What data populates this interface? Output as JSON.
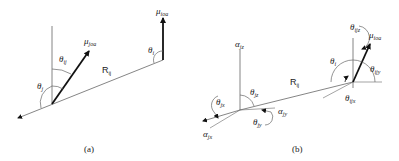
{
  "panels": [
    {
      "caption": "(a)",
      "labels": {
        "mu_joa": {
          "sym": "μ",
          "sub": "joa"
        },
        "mu_ioa": {
          "sym": "μ",
          "sub": "ioa"
        },
        "theta_ij": {
          "sym": "θ",
          "sub": "ij"
        },
        "theta_j": {
          "sym": "θ",
          "sub": "j"
        },
        "theta_i": {
          "sym": "θ",
          "sub": "i"
        },
        "R_ij": {
          "sym": "R",
          "sub": "ij"
        }
      }
    },
    {
      "caption": "(b)",
      "labels": {
        "alpha_jz": {
          "sym": "α",
          "sub": "jz"
        },
        "theta_jz": {
          "sym": "θ",
          "sub": "jz"
        },
        "theta_jx": {
          "sym": "θ",
          "sub": "jx"
        },
        "alpha_jx": {
          "sym": "α",
          "sub": "jx"
        },
        "alpha_jy": {
          "sym": "α",
          "sub": "jy"
        },
        "theta_jy": {
          "sym": "θ",
          "sub": "jy"
        },
        "R_ij": {
          "sym": "R",
          "sub": "ij"
        },
        "theta_i": {
          "sym": "θ",
          "sub": "i"
        },
        "theta_ijz": {
          "sym": "θ",
          "sub": "ijz"
        },
        "mu_ioa": {
          "sym": "μ",
          "sub": "ioa"
        },
        "theta_ijy": {
          "sym": "θ",
          "sub": "ijy"
        },
        "theta_ijx": {
          "sym": "θ",
          "sub": "ijx"
        }
      }
    }
  ],
  "colors": {
    "line": "#555555",
    "vector": "#111111",
    "text": "#222222"
  }
}
